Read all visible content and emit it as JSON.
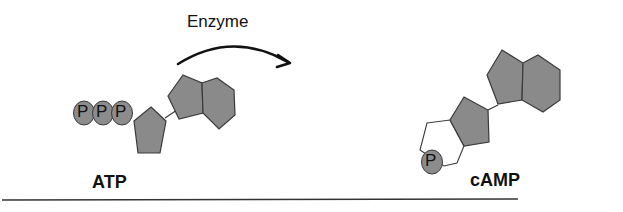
{
  "figure": {
    "type": "reaction-diagram",
    "reaction": {
      "enzyme_label": "Enzyme",
      "substrate": {
        "label": "ATP",
        "phosphates": [
          "P",
          "P",
          "P"
        ]
      },
      "product": {
        "label": "cAMP",
        "phosphates": [
          "P"
        ]
      }
    },
    "colors": {
      "ring_fill": "#8a8a8a",
      "ring_stroke": "#3a3a3a",
      "phosphate_fill": "#8c8c8c",
      "open_ring_fill": "#ffffff",
      "arrow": "#111111",
      "baseline": "#333333"
    }
  }
}
